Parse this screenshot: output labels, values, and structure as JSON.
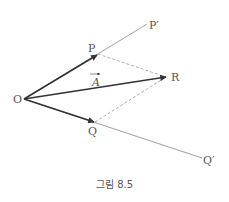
{
  "figure": {
    "caption": "그림 8.5",
    "labels": {
      "origin": "O",
      "p": "P",
      "p_prime": "P′",
      "q": "Q",
      "q_prime": "Q′",
      "r": "R",
      "vector": "A"
    },
    "colors": {
      "vector": "#333333",
      "ray": "#888888",
      "dashed": "#999999",
      "text": "#555555"
    }
  }
}
